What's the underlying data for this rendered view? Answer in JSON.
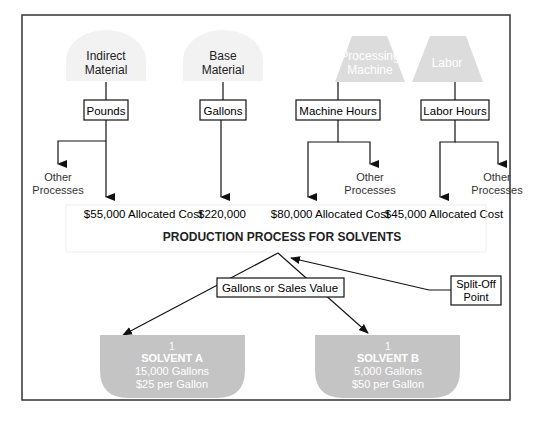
{
  "diagram": {
    "title": "PRODUCTION PROCESS FOR SOLVENTS",
    "colors": {
      "frame": "#333333",
      "light_shape": "#f2f2f2",
      "mid_shape": "#dcdcdc",
      "solvent_shape": "#c4c4c4",
      "light_text": "#ffffff",
      "dark_text": "#222222",
      "line": "#111111"
    },
    "inputs": [
      {
        "id": "indirect-material",
        "line1": "Indirect",
        "line2": "Material",
        "shape": "dome",
        "driver": "Pounds",
        "allocated": "$55,000 Allocated Cost",
        "other": [
          "Other",
          "Processes"
        ]
      },
      {
        "id": "base-material",
        "line1": "Base",
        "line2": "Material",
        "shape": "dome",
        "driver": "Gallons",
        "allocated": "$220,000"
      },
      {
        "id": "processing-machine",
        "line1": "Processing",
        "line2": "Machine",
        "shape": "trapezoid",
        "driver": "Machine Hours",
        "allocated": "$80,000 Allocated Cost",
        "other": [
          "Other",
          "Processes"
        ]
      },
      {
        "id": "labor",
        "line1": "Labor",
        "shape": "trapezoid",
        "driver": "Labor Hours",
        "allocated": "$45,000 Allocated Cost",
        "other": [
          "Other",
          "Processes"
        ]
      }
    ],
    "allocation_basis": "Gallons or Sales Value",
    "split_off": [
      "Split-Off",
      "Point"
    ],
    "outputs": [
      {
        "id": "solvent-a",
        "count": "1",
        "name": "SOLVENT A",
        "volume": "15,000 Gallons",
        "price": "$25 per Gallon"
      },
      {
        "id": "solvent-b",
        "count": "1",
        "name": "SOLVENT B",
        "volume": "5,000 Gallons",
        "price": "$50 per Gallon"
      }
    ]
  }
}
